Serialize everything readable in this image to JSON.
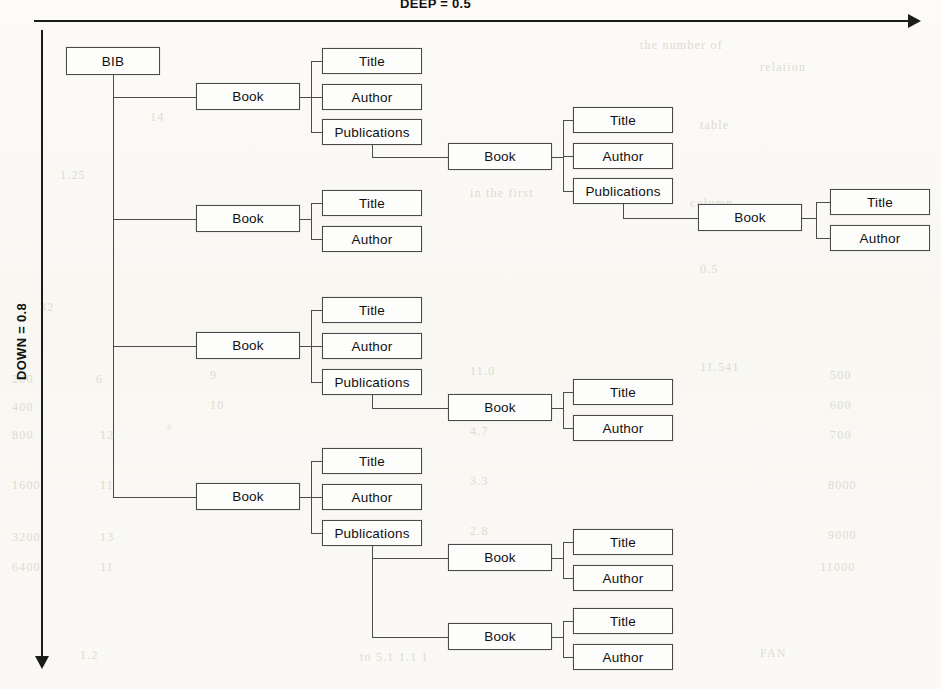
{
  "axes": {
    "deep_label": "DEEP = 0.5",
    "down_label": "DOWN = 0.8"
  },
  "diagram": {
    "type": "tree",
    "root": "BIB",
    "node_labels": {
      "root": "BIB",
      "book": "Book",
      "title": "Title",
      "author": "Author",
      "publications": "Publications"
    },
    "nodes": [
      {
        "id": "n0",
        "label": "BIB",
        "x": 66,
        "y": 47,
        "w": 94,
        "h": 28,
        "level": 0
      },
      {
        "id": "n1",
        "label": "Book",
        "x": 196,
        "y": 83,
        "w": 104,
        "h": 27,
        "level": 1
      },
      {
        "id": "n2",
        "label": "Title",
        "x": 322,
        "y": 48,
        "w": 100,
        "h": 26,
        "level": 2
      },
      {
        "id": "n3",
        "label": "Author",
        "x": 322,
        "y": 84,
        "w": 100,
        "h": 26,
        "level": 2
      },
      {
        "id": "n4",
        "label": "Publications",
        "x": 322,
        "y": 119,
        "w": 100,
        "h": 26,
        "level": 2
      },
      {
        "id": "n5",
        "label": "Book",
        "x": 448,
        "y": 143,
        "w": 104,
        "h": 27,
        "level": 3
      },
      {
        "id": "n6",
        "label": "Title",
        "x": 573,
        "y": 107,
        "w": 100,
        "h": 26,
        "level": 4
      },
      {
        "id": "n7",
        "label": "Author",
        "x": 573,
        "y": 143,
        "w": 100,
        "h": 26,
        "level": 4
      },
      {
        "id": "n8",
        "label": "Publications",
        "x": 573,
        "y": 178,
        "w": 100,
        "h": 26,
        "level": 4
      },
      {
        "id": "n9",
        "label": "Book",
        "x": 698,
        "y": 204,
        "w": 104,
        "h": 27,
        "level": 5
      },
      {
        "id": "n10",
        "label": "Title",
        "x": 830,
        "y": 189,
        "w": 100,
        "h": 26,
        "level": 6
      },
      {
        "id": "n11",
        "label": "Author",
        "x": 830,
        "y": 225,
        "w": 100,
        "h": 26,
        "level": 6
      },
      {
        "id": "n12",
        "label": "Book",
        "x": 196,
        "y": 205,
        "w": 104,
        "h": 27,
        "level": 1
      },
      {
        "id": "n13",
        "label": "Title",
        "x": 322,
        "y": 190,
        "w": 100,
        "h": 26,
        "level": 2
      },
      {
        "id": "n14",
        "label": "Author",
        "x": 322,
        "y": 226,
        "w": 100,
        "h": 26,
        "level": 2
      },
      {
        "id": "n15",
        "label": "Book",
        "x": 196,
        "y": 332,
        "w": 104,
        "h": 27,
        "level": 1
      },
      {
        "id": "n16",
        "label": "Title",
        "x": 322,
        "y": 297,
        "w": 100,
        "h": 26,
        "level": 2
      },
      {
        "id": "n17",
        "label": "Author",
        "x": 322,
        "y": 333,
        "w": 100,
        "h": 26,
        "level": 2
      },
      {
        "id": "n18",
        "label": "Publications",
        "x": 322,
        "y": 369,
        "w": 100,
        "h": 26,
        "level": 2
      },
      {
        "id": "n19",
        "label": "Book",
        "x": 448,
        "y": 394,
        "w": 104,
        "h": 27,
        "level": 3
      },
      {
        "id": "n20",
        "label": "Title",
        "x": 573,
        "y": 379,
        "w": 100,
        "h": 26,
        "level": 4
      },
      {
        "id": "n21",
        "label": "Author",
        "x": 573,
        "y": 415,
        "w": 100,
        "h": 26,
        "level": 4
      },
      {
        "id": "n22",
        "label": "Book",
        "x": 196,
        "y": 483,
        "w": 104,
        "h": 27,
        "level": 1
      },
      {
        "id": "n23",
        "label": "Title",
        "x": 322,
        "y": 448,
        "w": 100,
        "h": 26,
        "level": 2
      },
      {
        "id": "n24",
        "label": "Author",
        "x": 322,
        "y": 484,
        "w": 100,
        "h": 26,
        "level": 2
      },
      {
        "id": "n25",
        "label": "Publications",
        "x": 322,
        "y": 520,
        "w": 100,
        "h": 26,
        "level": 2
      },
      {
        "id": "n26",
        "label": "Book",
        "x": 448,
        "y": 544,
        "w": 104,
        "h": 27,
        "level": 3
      },
      {
        "id": "n27",
        "label": "Title",
        "x": 573,
        "y": 529,
        "w": 100,
        "h": 26,
        "level": 4
      },
      {
        "id": "n28",
        "label": "Author",
        "x": 573,
        "y": 565,
        "w": 100,
        "h": 26,
        "level": 4
      },
      {
        "id": "n29",
        "label": "Book",
        "x": 448,
        "y": 623,
        "w": 104,
        "h": 27,
        "level": 3
      },
      {
        "id": "n30",
        "label": "Title",
        "x": 573,
        "y": 608,
        "w": 100,
        "h": 26,
        "level": 4
      },
      {
        "id": "n31",
        "label": "Author",
        "x": 573,
        "y": 644,
        "w": 100,
        "h": 26,
        "level": 4
      }
    ],
    "edges": [
      {
        "from": "n0",
        "to": [
          "n1",
          "n12",
          "n15",
          "n22"
        ]
      },
      {
        "from": "n1",
        "to": [
          "n2",
          "n3",
          "n4"
        ]
      },
      {
        "from": "n4",
        "to": [
          "n5"
        ]
      },
      {
        "from": "n5",
        "to": [
          "n6",
          "n7",
          "n8"
        ]
      },
      {
        "from": "n8",
        "to": [
          "n9"
        ]
      },
      {
        "from": "n9",
        "to": [
          "n10",
          "n11"
        ]
      },
      {
        "from": "n12",
        "to": [
          "n13",
          "n14"
        ]
      },
      {
        "from": "n15",
        "to": [
          "n16",
          "n17",
          "n18"
        ]
      },
      {
        "from": "n18",
        "to": [
          "n19"
        ]
      },
      {
        "from": "n19",
        "to": [
          "n20",
          "n21"
        ]
      },
      {
        "from": "n22",
        "to": [
          "n23",
          "n24",
          "n25"
        ]
      },
      {
        "from": "n25",
        "to": [
          "n26",
          "n29"
        ]
      },
      {
        "from": "n26",
        "to": [
          "n27",
          "n28"
        ]
      },
      {
        "from": "n29",
        "to": [
          "n30",
          "n31"
        ]
      }
    ]
  },
  "background_ghost_text": [
    {
      "x": 640,
      "y": 38,
      "t": "the number of"
    },
    {
      "x": 760,
      "y": 60,
      "t": "relation"
    },
    {
      "x": 150,
      "y": 110,
      "t": "14"
    },
    {
      "x": 700,
      "y": 118,
      "t": "table"
    },
    {
      "x": 60,
      "y": 168,
      "t": "1.25"
    },
    {
      "x": 470,
      "y": 186,
      "t": "in the first"
    },
    {
      "x": 690,
      "y": 196,
      "t": "column"
    },
    {
      "x": 40,
      "y": 300,
      "t": "32"
    },
    {
      "x": 700,
      "y": 262,
      "t": "0.5"
    },
    {
      "x": 12,
      "y": 372,
      "t": "200"
    },
    {
      "x": 96,
      "y": 372,
      "t": "6"
    },
    {
      "x": 210,
      "y": 368,
      "t": "9"
    },
    {
      "x": 470,
      "y": 364,
      "t": "11.0"
    },
    {
      "x": 700,
      "y": 360,
      "t": "11.541"
    },
    {
      "x": 830,
      "y": 368,
      "t": "500"
    },
    {
      "x": 12,
      "y": 400,
      "t": "400"
    },
    {
      "x": 210,
      "y": 398,
      "t": "10"
    },
    {
      "x": 480,
      "y": 396,
      "t": "5.5"
    },
    {
      "x": 830,
      "y": 398,
      "t": "600"
    },
    {
      "x": 12,
      "y": 428,
      "t": "800"
    },
    {
      "x": 100,
      "y": 428,
      "t": "12"
    },
    {
      "x": 470,
      "y": 424,
      "t": "4.7"
    },
    {
      "x": 830,
      "y": 428,
      "t": "700"
    },
    {
      "x": 12,
      "y": 478,
      "t": "1600"
    },
    {
      "x": 100,
      "y": 478,
      "t": "11"
    },
    {
      "x": 470,
      "y": 474,
      "t": "3.3"
    },
    {
      "x": 828,
      "y": 478,
      "t": "8000"
    },
    {
      "x": 12,
      "y": 530,
      "t": "3200"
    },
    {
      "x": 100,
      "y": 530,
      "t": "13"
    },
    {
      "x": 470,
      "y": 524,
      "t": "2.8"
    },
    {
      "x": 828,
      "y": 528,
      "t": "9000"
    },
    {
      "x": 12,
      "y": 560,
      "t": "6400"
    },
    {
      "x": 100,
      "y": 560,
      "t": "11"
    },
    {
      "x": 468,
      "y": 556,
      "t": "5.1"
    },
    {
      "x": 820,
      "y": 560,
      "t": "11000"
    },
    {
      "x": 80,
      "y": 648,
      "t": "1.2"
    },
    {
      "x": 360,
      "y": 650,
      "t": "to 5.1 1.1 1"
    },
    {
      "x": 760,
      "y": 646,
      "t": "FAN"
    }
  ]
}
